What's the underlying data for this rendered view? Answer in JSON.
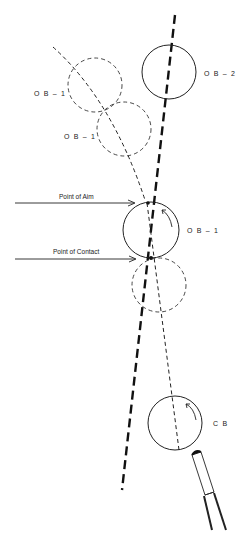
{
  "diagram": {
    "title": "",
    "labels": {
      "ob2": "O B – 2",
      "ob1_ghost_upper": "O B – 1",
      "ob1_ghost_lower": "O B – 1",
      "ob1": "O B – 1",
      "cb": "C B",
      "point_of_aim": "Point of Aim",
      "point_of_contact": "Point of Contact"
    },
    "colors": {
      "ink": "#1a1a1a",
      "background": "#ffffff"
    }
  }
}
